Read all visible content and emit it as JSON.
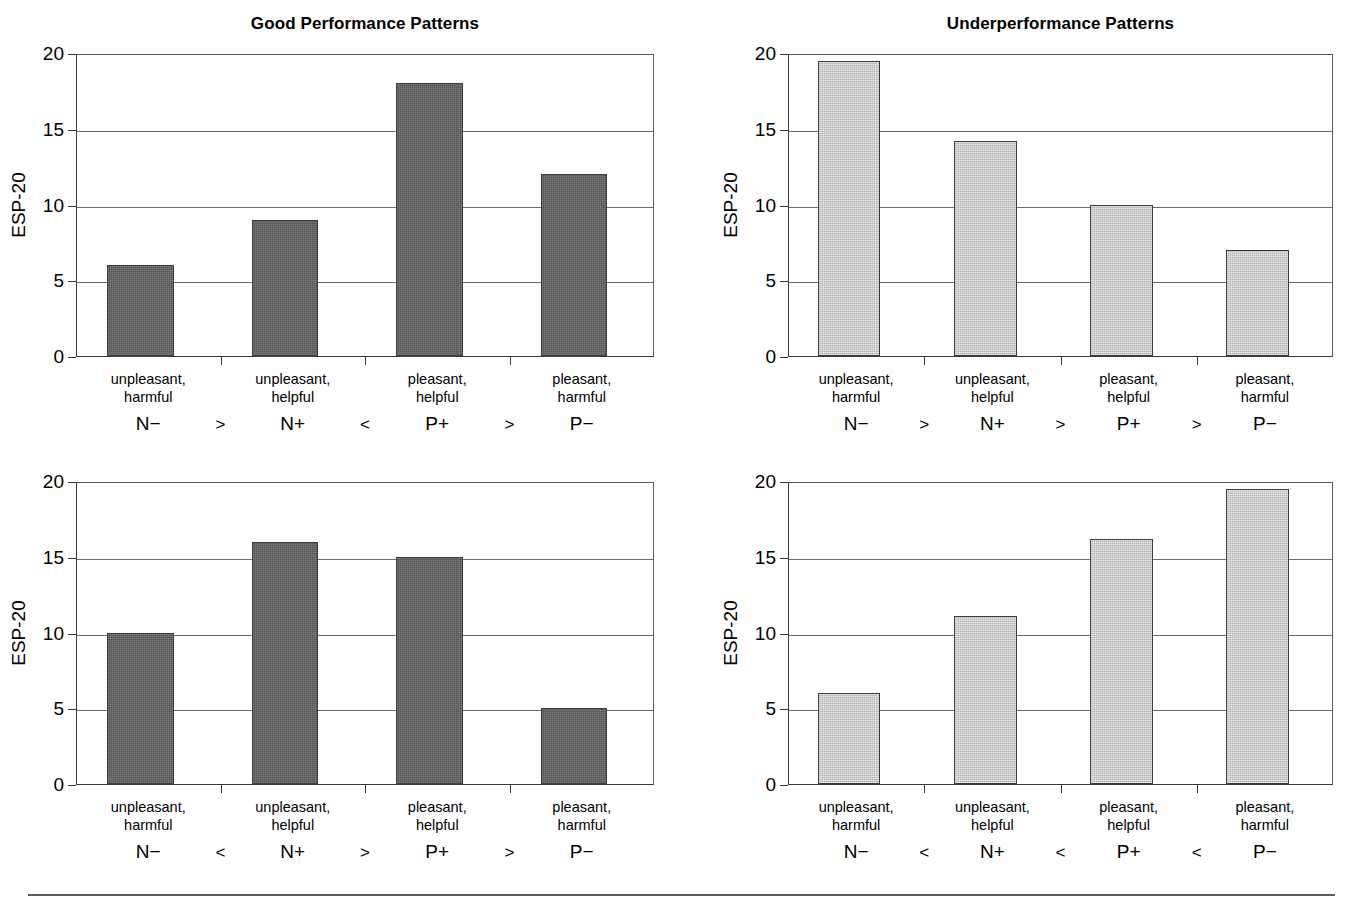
{
  "figure": {
    "has_footer_rule": true,
    "bar_color_dark": "#565656",
    "bar_color_light": "#b4b4b4",
    "axis_color": "#3a3a3a",
    "grid_color": "#6b6b6b"
  },
  "common": {
    "ylabel": "ESP-20",
    "yticks": [
      "0",
      "5",
      "10",
      "15",
      "20"
    ],
    "categories": [
      {
        "line1": "unpleasant,",
        "line2": "harmful"
      },
      {
        "line1": "unpleasant,",
        "line2": "helpful"
      },
      {
        "line1": "pleasant,",
        "line2": "helpful"
      },
      {
        "line1": "pleasant,",
        "line2": "harmful"
      }
    ],
    "codes": [
      "N−",
      "N+",
      "P+",
      "P−"
    ]
  },
  "panels": [
    {
      "id": "good-performance-top",
      "title": "Good Performance Patterns",
      "shade": "dark",
      "operators": [
        ">",
        "<",
        ">"
      ],
      "values": [
        6,
        9,
        18,
        12
      ]
    },
    {
      "id": "underperformance-top",
      "title": "Underperformance Patterns",
      "shade": "light",
      "operators": [
        ">",
        ">",
        ">"
      ],
      "values": [
        19.5,
        14.2,
        10,
        7
      ]
    },
    {
      "id": "good-performance-bottom",
      "title": "",
      "shade": "dark",
      "operators": [
        "<",
        ">",
        ">"
      ],
      "values": [
        10,
        16,
        15,
        5
      ]
    },
    {
      "id": "underperformance-bottom",
      "title": "",
      "shade": "light",
      "operators": [
        "<",
        "<",
        "<"
      ],
      "values": [
        6,
        11.1,
        16.2,
        19.5
      ]
    }
  ],
  "chart_data": [
    {
      "type": "bar",
      "title": "Good Performance Patterns",
      "subtitle": "",
      "xlabel": "",
      "ylabel": "ESP-20",
      "ylim": [
        0,
        20
      ],
      "yticks": [
        0,
        5,
        10,
        15,
        20
      ],
      "grid": "horizontal",
      "legend": "none",
      "categories": [
        "unpleasant, harmful",
        "unpleasant, helpful",
        "pleasant, helpful",
        "pleasant, harmful"
      ],
      "category_codes": [
        "N−",
        "N+",
        "P+",
        "P−"
      ],
      "values": [
        6,
        9,
        18,
        12
      ],
      "annotations": [
        "N− > N+ < P+ > P−"
      ],
      "bar_color": "#565656"
    },
    {
      "type": "bar",
      "title": "Underperformance Patterns",
      "subtitle": "",
      "xlabel": "",
      "ylabel": "ESP-20",
      "ylim": [
        0,
        20
      ],
      "yticks": [
        0,
        5,
        10,
        15,
        20
      ],
      "grid": "horizontal",
      "legend": "none",
      "categories": [
        "unpleasant, harmful",
        "unpleasant, helpful",
        "pleasant, helpful",
        "pleasant, harmful"
      ],
      "category_codes": [
        "N−",
        "N+",
        "P+",
        "P−"
      ],
      "values": [
        19.5,
        14.2,
        10,
        7
      ],
      "annotations": [
        "N− > N+ > P+ > P−"
      ],
      "bar_color": "#b4b4b4"
    },
    {
      "type": "bar",
      "title": "",
      "subtitle": "",
      "xlabel": "",
      "ylabel": "ESP-20",
      "ylim": [
        0,
        20
      ],
      "yticks": [
        0,
        5,
        10,
        15,
        20
      ],
      "grid": "horizontal",
      "legend": "none",
      "categories": [
        "unpleasant, harmful",
        "unpleasant, helpful",
        "pleasant, helpful",
        "pleasant, harmful"
      ],
      "category_codes": [
        "N−",
        "N+",
        "P+",
        "P−"
      ],
      "values": [
        10,
        16,
        15,
        5
      ],
      "annotations": [
        "N− < N+ > P+ > P−"
      ],
      "bar_color": "#565656"
    },
    {
      "type": "bar",
      "title": "",
      "subtitle": "",
      "xlabel": "",
      "ylabel": "ESP-20",
      "ylim": [
        0,
        20
      ],
      "yticks": [
        0,
        5,
        10,
        15,
        20
      ],
      "grid": "horizontal",
      "legend": "none",
      "categories": [
        "unpleasant, harmful",
        "unpleasant, helpful",
        "pleasant, helpful",
        "pleasant, harmful"
      ],
      "category_codes": [
        "N−",
        "N+",
        "P+",
        "P−"
      ],
      "values": [
        6,
        11.1,
        16.2,
        19.5
      ],
      "annotations": [
        "N− < N+ < P+ < P−"
      ],
      "bar_color": "#b4b4b4"
    }
  ]
}
